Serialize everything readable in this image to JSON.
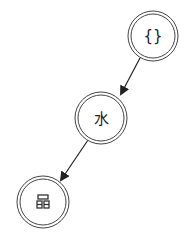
{
  "diagram": {
    "type": "tree",
    "nodes": [
      {
        "id": "n1",
        "label": "{}",
        "icon": "braces-icon",
        "cx": 153,
        "cy": 36
      },
      {
        "id": "n2",
        "label": "水",
        "icon": "water-character",
        "cx": 101,
        "cy": 118
      },
      {
        "id": "n3",
        "label": "",
        "icon": "hierarchy-icon",
        "cx": 43,
        "cy": 202
      }
    ],
    "edges": [
      {
        "from": "n1",
        "to": "n2"
      },
      {
        "from": "n2",
        "to": "n3"
      }
    ],
    "colors": {
      "stroke": "#333333",
      "background": "#ffffff"
    }
  }
}
